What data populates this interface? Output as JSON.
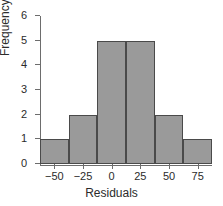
{
  "chart_data": {
    "type": "bar",
    "title": "",
    "xlabel": "Residuals",
    "ylabel": "Frequency",
    "categories": [
      "-62.5 to -37.5",
      "-37.5 to -12.5",
      "-12.5 to 12.5",
      "12.5 to 37.5",
      "37.5 to 62.5",
      "62.5 to 87.5"
    ],
    "bin_edges": [
      -62.5,
      -37.5,
      -12.5,
      12.5,
      37.5,
      62.5,
      87.5
    ],
    "values": [
      1,
      2,
      5,
      5,
      2,
      1
    ],
    "xtick_labels": [
      "−50",
      "−25",
      "0",
      "25",
      "50",
      "75"
    ],
    "xtick_values": [
      -50,
      -25,
      0,
      25,
      50,
      75
    ],
    "ytick_labels": [
      "0",
      "1",
      "2",
      "3",
      "4",
      "5",
      "6"
    ],
    "ytick_values": [
      0,
      1,
      2,
      3,
      4,
      5,
      6
    ],
    "ylim": [
      0,
      6
    ],
    "xlim": [
      -62.5,
      87.5
    ],
    "grid": false,
    "legend": false,
    "bar_fill_color": "#9a9a9a",
    "bar_edge_color": "#4a4a4a",
    "axis_color": "#6d6d6d",
    "background_color": "#ffffff"
  }
}
